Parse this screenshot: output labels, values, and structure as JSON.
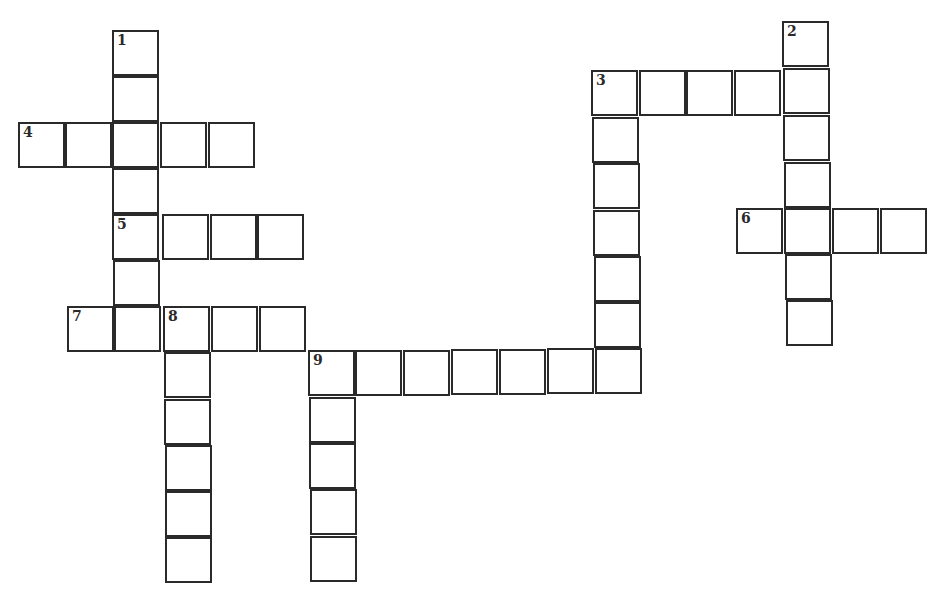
{
  "puzzle": {
    "type": "crossword",
    "border_color": "#2a2a2a",
    "background_color": "#ffffff",
    "words": [
      {
        "number": "1",
        "direction": "down",
        "length": 7
      },
      {
        "number": "2",
        "direction": "down",
        "length": 7
      },
      {
        "number": "3",
        "direction": "across",
        "length": 5
      },
      {
        "number": "3",
        "direction": "down",
        "length": 7
      },
      {
        "number": "4",
        "direction": "across",
        "length": 5
      },
      {
        "number": "5",
        "direction": "across",
        "length": 4
      },
      {
        "number": "6",
        "direction": "across",
        "length": 4
      },
      {
        "number": "7",
        "direction": "across",
        "length": 5
      },
      {
        "number": "8",
        "direction": "down",
        "length": 6
      },
      {
        "number": "9",
        "direction": "across",
        "length": 7
      },
      {
        "number": "9",
        "direction": "down",
        "length": 5
      }
    ],
    "clue_numbers": [
      "1",
      "2",
      "3",
      "4",
      "5",
      "6",
      "7",
      "8",
      "9"
    ],
    "cell_values": {}
  }
}
